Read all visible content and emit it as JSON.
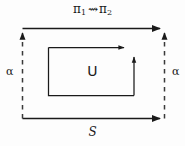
{
  "figure": {
    "type": "commutative-square-diagram",
    "background_color": "#fdfdfd",
    "stroke_color": "#1a1a1a",
    "labels": {
      "top_left_symbol": "π",
      "top_left_subscript": "1",
      "top_relation": "⇝",
      "top_right_symbol": "π",
      "top_right_subscript": "2",
      "left_side": "α",
      "right_side": "α",
      "center": "U",
      "bottom": "S"
    },
    "edges": [
      {
        "name": "top-edge",
        "style": "solid",
        "direction": "right",
        "arrowhead": true,
        "label": "π₁ ⇝ π₂"
      },
      {
        "name": "left-edge",
        "style": "dashed",
        "direction": "up",
        "arrowhead": true,
        "label": "α"
      },
      {
        "name": "right-edge",
        "style": "dashed",
        "direction": "up",
        "arrowhead": true,
        "label": "α"
      },
      {
        "name": "bottom-edge",
        "style": "solid",
        "direction": "right",
        "arrowhead": true,
        "label": "S"
      },
      {
        "name": "inner-top-edge",
        "style": "solid",
        "direction": "right",
        "arrowhead": true,
        "label": ""
      },
      {
        "name": "inner-right-edge",
        "style": "solid",
        "direction": "up",
        "arrowhead": true,
        "label": ""
      },
      {
        "name": "inner-left-edge",
        "style": "solid",
        "direction": "none",
        "arrowhead": false,
        "label": ""
      },
      {
        "name": "inner-bottom-edge",
        "style": "solid",
        "direction": "none",
        "arrowhead": false,
        "label": ""
      }
    ]
  }
}
